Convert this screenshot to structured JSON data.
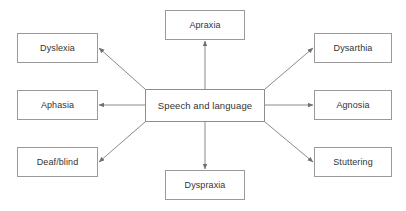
{
  "diagram": {
    "title": "Speech and language",
    "type": "radial-concept-map",
    "colors": {
      "background": "#ffffff",
      "box_border": "#9a9a9a",
      "box_fill": "#ffffff",
      "text": "#333333",
      "edge": "#7d7d7d"
    },
    "center": {
      "label": "Speech and language",
      "x": 145,
      "y": 89,
      "w": 120,
      "h": 33
    },
    "nodes": [
      {
        "id": "apraxia",
        "label": "Apraxia",
        "x": 165,
        "y": 10,
        "w": 80,
        "h": 30
      },
      {
        "id": "dyslexia",
        "label": "Dyslexia",
        "x": 17,
        "y": 33,
        "w": 81,
        "h": 30
      },
      {
        "id": "dysarthia",
        "label": "Dysarthia",
        "x": 314,
        "y": 33,
        "w": 78,
        "h": 30
      },
      {
        "id": "aphasia",
        "label": "Aphasia",
        "x": 17,
        "y": 90,
        "w": 81,
        "h": 30
      },
      {
        "id": "agnosia",
        "label": "Agnosia",
        "x": 314,
        "y": 90,
        "w": 78,
        "h": 30
      },
      {
        "id": "deaf-blind",
        "label": "Deaf/blind",
        "x": 17,
        "y": 147,
        "w": 81,
        "h": 30
      },
      {
        "id": "stuttering",
        "label": "Stuttering",
        "x": 314,
        "y": 147,
        "w": 78,
        "h": 30
      },
      {
        "id": "dyspraxia",
        "label": "Dyspraxia",
        "x": 165,
        "y": 170,
        "w": 80,
        "h": 30
      }
    ],
    "edges": [
      {
        "id": "center-to-apraxia",
        "from": "center",
        "to": "apraxia",
        "x1": 205,
        "y1": 89,
        "x2": 205,
        "y2": 41
      },
      {
        "id": "center-to-dyspraxia",
        "from": "center",
        "to": "dyspraxia",
        "x1": 205,
        "y1": 122,
        "x2": 205,
        "y2": 169
      },
      {
        "id": "center-to-aphasia",
        "from": "center",
        "to": "aphasia",
        "x1": 145,
        "y1": 105,
        "x2": 99,
        "y2": 105
      },
      {
        "id": "center-to-agnosia",
        "from": "center",
        "to": "agnosia",
        "x1": 265,
        "y1": 105,
        "x2": 313,
        "y2": 105
      },
      {
        "id": "center-to-dyslexia",
        "from": "center",
        "to": "dyslexia",
        "x1": 145,
        "y1": 89,
        "x2": 99,
        "y2": 48
      },
      {
        "id": "center-to-dysarthia",
        "from": "center",
        "to": "dysarthia",
        "x1": 265,
        "y1": 89,
        "x2": 313,
        "y2": 48
      },
      {
        "id": "center-to-deaf-blind",
        "from": "center",
        "to": "deaf-blind",
        "x1": 145,
        "y1": 122,
        "x2": 99,
        "y2": 162
      },
      {
        "id": "center-to-stuttering",
        "from": "center",
        "to": "stuttering",
        "x1": 265,
        "y1": 122,
        "x2": 313,
        "y2": 162
      }
    ]
  }
}
